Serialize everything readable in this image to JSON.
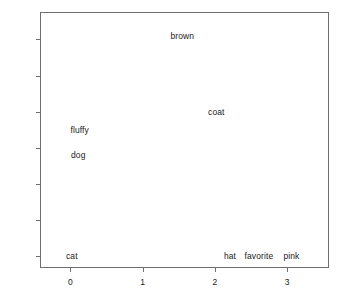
{
  "chart_data": {
    "type": "scatter",
    "title": "",
    "xlabel": "",
    "ylabel": "",
    "xlim": [
      -0.42,
      3.58
    ],
    "ylim": [
      -0.16,
      3.38
    ],
    "grid": false,
    "legend": null,
    "marker": "text-label-only",
    "xticks": [
      0,
      1,
      2,
      3
    ],
    "xticklabels": [
      "0",
      "1",
      "2",
      "3"
    ],
    "yticks": [
      0.0,
      0.5,
      1.0,
      1.5,
      2.0,
      2.5,
      3.0
    ],
    "yticklabels": [
      "0.0",
      "0.5",
      "1.0",
      "1.5",
      "2.0",
      "2.5",
      "3.0"
    ],
    "labels": [
      "cat",
      "dog",
      "fluffy",
      "brown",
      "coat",
      "hat",
      "favorite",
      "pink"
    ],
    "x": [
      0.02,
      0.11,
      0.13,
      1.55,
      2.02,
      2.21,
      2.61,
      3.06
    ],
    "y": [
      0.0,
      1.4,
      1.75,
      3.05,
      2.0,
      0.0,
      0.0,
      0.0
    ],
    "points": [
      {
        "label": "cat",
        "x": 0.02,
        "y": 0.0
      },
      {
        "label": "dog",
        "x": 0.11,
        "y": 1.4
      },
      {
        "label": "fluffy",
        "x": 0.13,
        "y": 1.75
      },
      {
        "label": "brown",
        "x": 1.55,
        "y": 3.05
      },
      {
        "label": "coat",
        "x": 2.02,
        "y": 2.0
      },
      {
        "label": "hat",
        "x": 2.21,
        "y": 0.0
      },
      {
        "label": "favorite",
        "x": 2.61,
        "y": 0.0
      },
      {
        "label": "pink",
        "x": 3.06,
        "y": 0.0
      }
    ],
    "colors": {
      "background": "#ffffff",
      "frame": "#6f6f6f",
      "text": "#1a1a1a"
    }
  }
}
